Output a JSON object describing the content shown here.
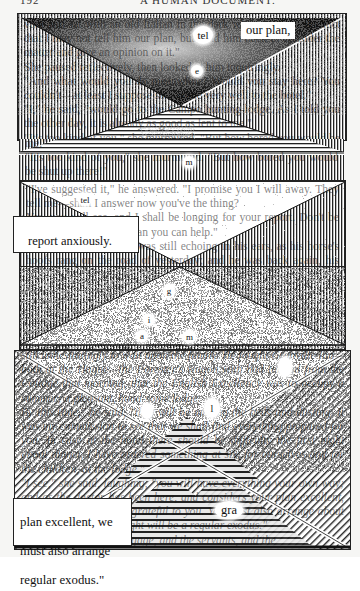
{
  "running_head": {
    "page_number": "192",
    "title": "A HUMAN DOCUMENT."
  },
  "colors": {
    "ink": "#111111",
    "paper": "#ffffff",
    "night": "#0e0e0e"
  },
  "panels": [
    {
      "id": "panel-1",
      "pattern": "vertical-lines-with-night-sky-triangle-and-horizontal-floor",
      "body_text": "vant and sat with an old Italian in the dark who was the... the fact that I may not tell him our plan, but send him back to consider the matter and give an opinion on it.\"\n  She paused reflectively, then looked at him inquiringly.\n\"And what would you do meanwhile? Would you stay here? You couldn't—at least I suppose so—come very well to the hotel.\"\n  \"I,\" he said, \"would go to the Campo hunting-lodge. As I told you the other day, it is already as good as lent to me.\"\n  \"It's too kind of you,\" she murmured. \"But how bored you would be shut up there!\"",
      "bubbles": [
        {
          "text": "tel",
          "name": "bubble-tel"
        },
        {
          "text": "e",
          "name": "bubble-e"
        }
      ],
      "caption": "our plan,"
    },
    {
      "id": "panel-2",
      "pattern": "vertical-lines-with-stippled-inverted-triangle",
      "body_text": "\"I've suggested it,\" he answered. \"I promise you I will away. They tell me—shall I answer now you've the thing?\n  Yes, you will see, and I shall be longing for your report. Don't be too long—any longer than you can help.\"\n  This parting injunction was still echoing in his ears, as his horse's hoofs rang on the road of yesterday; and he was back again, his mission accomplished, before she had begun expecting him. The Contessa, as usual, had been charmed at his prompt return, while Vera, on finding out the reason of it, listened attentively to the details of the hike were evidently pleasing, and",
      "bubbles": [],
      "caption": "report anxiously.\n\"can help.\""
    },
    {
      "id": "panel-3",
      "pattern": "squiggle-texture-triangle",
      "body_text": "",
      "bubbles": [
        {
          "text": "g",
          "name": "bubble-g"
        },
        {
          "text": "i",
          "name": "bubble-i"
        },
        {
          "text": "a",
          "name": "bubble-a"
        },
        {
          "text": "m",
          "name": "bubble-m"
        }
      ],
      "caption": ""
    },
    {
      "id": "panel-4",
      "pattern": "diagonal-hatching-x-with-horizontal-pyramids",
      "body_text": "still unhesitatingly to wait upon the family. He fought Granville Inn—both at the Hague—the Forester's wagon with had tarried from the Cottage that morning, that the English Excellency was to occupy a summer; a pleasant, hand-some lodge.\n  By this time,\" he said, \"they will be making the beds and dusting. It was my commission to see that we shall find everything prepared for you. In case at the hotel there should be difficulty the first night about dinner, I have ordered something at six, for ourselves and for the children, at the lodge.\"\n  \"I see,\" she said, laughing, \"you will have everything your own way; and as the doctor has been here, and considers your plan excellent, we are all bound to be grateful to you. You must also arrange about the carriages.\" \"Our flight will be a regular exodus.\"\n  And indeed with the luggage, and the servants, and the",
      "bubbles": [
        {
          "text": "",
          "name": "bubble-empty-1"
        },
        {
          "text": "l",
          "name": "bubble-l"
        },
        {
          "text": "",
          "name": "bubble-empty-2"
        },
        {
          "text": "gra",
          "name": "bubble-gra"
        }
      ],
      "caption": "plan excellent, we are all bound to be gra\nmust also arrange\nregular exodus.\""
    }
  ],
  "visible_captions": {
    "top": "our plan,",
    "middle_line1": "report anxiously.",
    "middle_line2": "\"can help.\"",
    "bottom_line1": "plan excellent, we",
    "bottom_line2": "must also arrange",
    "bottom_line3": "regular exodus.\"",
    "bottom_bubble": "gra"
  }
}
